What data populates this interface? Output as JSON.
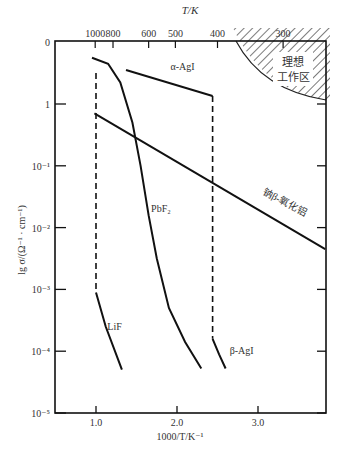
{
  "chart_data": {
    "type": "line",
    "title": "",
    "xlabel": "1000/T/K⁻¹",
    "ylabel": "lg σ/(Ω⁻¹ · cm⁻¹)",
    "top_axis_label": "T/K",
    "xlim": [
      0.5,
      3.83
    ],
    "ylim_log10": [
      -5,
      1.3
    ],
    "x_ticks": [
      {
        "value": 1.0,
        "label": "1.0"
      },
      {
        "value": 2.0,
        "label": "2.0"
      },
      {
        "value": 3.0,
        "label": "3.0"
      }
    ],
    "y_ticks": [
      {
        "value": 1.0,
        "label": "0"
      },
      {
        "value": 0,
        "label": "1"
      },
      {
        "value": -1,
        "label": "10⁻¹"
      },
      {
        "value": -2,
        "label": "10⁻²"
      },
      {
        "value": -3,
        "label": "10⁻³"
      },
      {
        "value": -4,
        "label": "10⁻⁴"
      },
      {
        "value": -5,
        "label": "10⁻⁵"
      }
    ],
    "top_ticks": [
      {
        "label": "1000",
        "x": 0.99
      },
      {
        "label": "800",
        "x": 1.21
      },
      {
        "label": "600",
        "x": 1.65
      },
      {
        "label": "500",
        "x": 1.98
      },
      {
        "label": "400",
        "x": 2.5
      },
      {
        "label": "300",
        "x": 3.31
      }
    ],
    "grid": false,
    "series": [
      {
        "name": "LiF",
        "style": "solid",
        "points": [
          [
            1.0,
            -3.05
          ],
          [
            1.12,
            -3.6
          ],
          [
            1.32,
            -4.3
          ]
        ]
      },
      {
        "name": "LiF transition",
        "style": "dashed",
        "points": [
          [
            1.0,
            0.5
          ],
          [
            1.0,
            -3.05
          ]
        ]
      },
      {
        "name": "PbF₂",
        "style": "solid",
        "points": [
          [
            0.95,
            0.75
          ],
          [
            1.15,
            0.65
          ],
          [
            1.3,
            0.35
          ],
          [
            1.45,
            -0.3
          ],
          [
            1.55,
            -1.0
          ],
          [
            1.65,
            -1.8
          ],
          [
            1.75,
            -2.5
          ],
          [
            1.9,
            -3.3
          ],
          [
            2.1,
            -3.85
          ],
          [
            2.3,
            -4.28
          ]
        ]
      },
      {
        "name": "α-AgI",
        "style": "solid",
        "points": [
          [
            1.37,
            0.55
          ],
          [
            2.44,
            0.13
          ]
        ]
      },
      {
        "name": "AgI transition",
        "style": "dashed",
        "points": [
          [
            2.44,
            0.13
          ],
          [
            2.44,
            -3.8
          ]
        ]
      },
      {
        "name": "β-AgI",
        "style": "solid",
        "points": [
          [
            2.44,
            -3.8
          ],
          [
            2.52,
            -4.05
          ],
          [
            2.6,
            -4.28
          ]
        ]
      },
      {
        "name": "钠β-氧化铝",
        "style": "solid",
        "points": [
          [
            0.98,
            -0.15
          ],
          [
            3.83,
            -2.35
          ]
        ]
      }
    ],
    "annotations": [
      {
        "text": "LiF",
        "x": 1.14,
        "y": -3.65
      },
      {
        "text": "PbF₂",
        "x": 1.68,
        "y": -1.75
      },
      {
        "text": "α-AgI",
        "x": 1.92,
        "y": 0.55
      },
      {
        "text": "β-AgI",
        "x": 2.65,
        "y": -4.05
      },
      {
        "text": "钠β-氧化铝",
        "x": 3.05,
        "y": -1.45,
        "rotate": 28
      },
      {
        "text": "理想",
        "x": 3.5,
        "y": 0.45
      },
      {
        "text": "工作区",
        "x": 3.5,
        "y": 0.17
      }
    ],
    "ideal_region": {
      "label_line1": "理想",
      "label_line2": "工作区",
      "hatched": true
    }
  }
}
